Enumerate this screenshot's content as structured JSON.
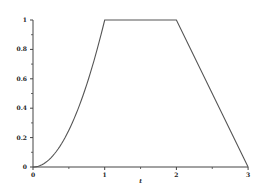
{
  "chart_data": {
    "type": "line",
    "title": "",
    "xlabel": "t",
    "ylabel": "",
    "xlim": [
      0,
      3
    ],
    "ylim": [
      0,
      1
    ],
    "grid": false,
    "legend": null,
    "x_ticks": [
      0,
      1,
      2,
      3
    ],
    "x_tick_labels": [
      "0",
      "1",
      "2",
      "3"
    ],
    "x_minor_ticks": [
      0.5,
      1.5,
      2.5
    ],
    "y_ticks": [
      0,
      0.2,
      0.4,
      0.6,
      0.8,
      1
    ],
    "y_tick_labels": [
      "0",
      "0.2",
      "0.4",
      "0.6",
      "0.8",
      "1"
    ],
    "y_minor_ticks": [
      0.1,
      0.3,
      0.5,
      0.7,
      0.9
    ],
    "series": [
      {
        "name": "f(t)",
        "description": "t^2 on [0,1], 1 on [1,2], 3-t on [2,3]",
        "x": [
          0,
          0.1,
          0.2,
          0.3,
          0.4,
          0.5,
          0.6,
          0.7,
          0.8,
          0.9,
          1.0,
          2.0,
          3.0
        ],
        "y": [
          0,
          0.01,
          0.04,
          0.09,
          0.16,
          0.25,
          0.36,
          0.49,
          0.64,
          0.81,
          1.0,
          1.0,
          0
        ],
        "color": "#555555"
      }
    ]
  },
  "layout": {
    "origin_px": [
      33,
      167
    ],
    "x_px_per_unit": 71.7,
    "y_px_per_unit": 147
  }
}
